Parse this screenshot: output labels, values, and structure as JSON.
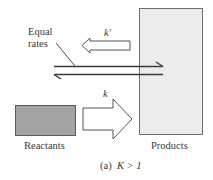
{
  "diagram": {
    "type": "chemical-equilibrium",
    "labels": {
      "equal_rates_line1": "Equal",
      "equal_rates_line2": "rates",
      "reverse_rate_constant": "k′",
      "forward_rate_constant": "k",
      "reactants": "Reactants",
      "products": "Products",
      "caption_tag": "(a)",
      "caption_expr": "K > 1"
    },
    "colors": {
      "reactants_fill": "#a3a3a3",
      "products_fill": "#ececec",
      "box_border": "#6e6e6e",
      "arrow_fill": "#ffffff",
      "arrow_stroke": "#555555",
      "line": "#3a3a3a"
    }
  }
}
